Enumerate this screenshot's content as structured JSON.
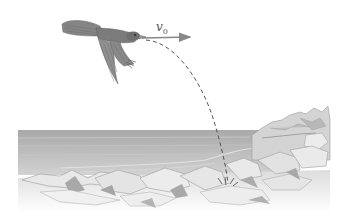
{
  "figure": {
    "velocity_label": {
      "symbol": "v",
      "subscript": "0"
    }
  },
  "colors": {
    "background": "#ffffff",
    "sea": "#b9b9b9",
    "sea_dark": "#a6a6a6",
    "rock_light": "#e6e6e6",
    "rock_shadow": "#a9a9a9",
    "bird_body": "#7d7d7d",
    "bird_wing": "#8c8c8c",
    "arrow": "#888888",
    "trajectory": "#555555"
  }
}
